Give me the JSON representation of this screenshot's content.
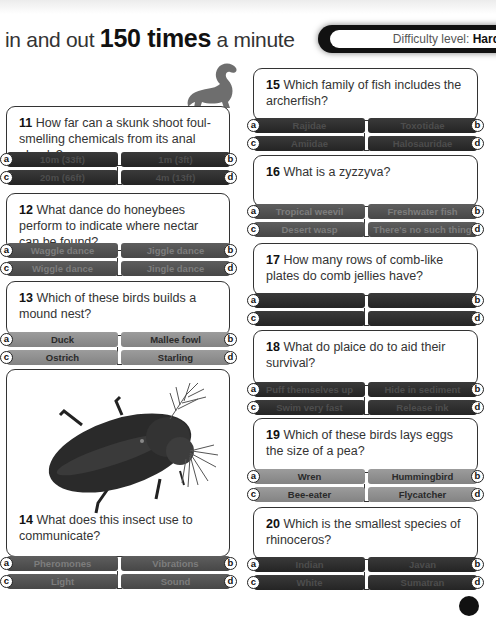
{
  "header": {
    "title_prefix": "in and out ",
    "title_bold": "150 times",
    "title_suffix": " a minute",
    "difficulty_label": "Difficulty level: ",
    "difficulty_value": "Hard"
  },
  "questions": [
    {
      "number": "11",
      "text": "How far can a skunk shoot foul-smelling chemicals from its anal glands?",
      "shade": "dark",
      "options": {
        "a": "10m (33ft)",
        "b": "1m (3ft)",
        "c": "20m (66ft)",
        "d": "4m (13ft)"
      }
    },
    {
      "number": "12",
      "text": "What dance do honeybees perform to indicate where nectar can be found?",
      "shade": "mid",
      "options": {
        "a": "Waggle dance",
        "b": "Jiggle dance",
        "c": "Wiggle dance",
        "d": "Jingle dance"
      }
    },
    {
      "number": "13",
      "text": "Which of these birds builds a mound nest?",
      "shade": "light",
      "options": {
        "a": "Duck",
        "b": "Mallee fowl",
        "c": "Ostrich",
        "d": "Starling"
      }
    },
    {
      "number": "14",
      "text": "What does this insect use to communicate?",
      "shade": "mid",
      "options": {
        "a": "Pheromones",
        "b": "Vibrations",
        "c": "Light",
        "d": "Sound"
      }
    },
    {
      "number": "15",
      "text": "Which family of fish includes the archerfish?",
      "shade": "dark",
      "options": {
        "a": "Rajidae",
        "b": "Toxotidae",
        "c": "Amiidae",
        "d": "Halosauridae"
      }
    },
    {
      "number": "16",
      "text": "What is a zyzzyva?",
      "shade": "mid",
      "options": {
        "a": "Tropical weevil",
        "b": "Freshwater fish",
        "c": "Desert wasp",
        "d": "There's no such thing"
      }
    },
    {
      "number": "17",
      "text": "How many rows of comb-like plates do comb jellies have?",
      "shade": "dark",
      "options": {
        "a": "",
        "b": "",
        "c": "",
        "d": ""
      }
    },
    {
      "number": "18",
      "text": "What do plaice do to aid their survival?",
      "shade": "dark",
      "options": {
        "a": "Puff themselves up",
        "b": "Hide in sediment",
        "c": "Swim very fast",
        "d": "Release ink"
      }
    },
    {
      "number": "19",
      "text": "Which of these birds lays eggs the size of a pea?",
      "shade": "light",
      "options": {
        "a": "Wren",
        "b": "Hummingbird",
        "c": "Bee-eater",
        "d": "Flycatcher"
      }
    },
    {
      "number": "20",
      "text": "Which is the smallest species of rhinoceros?",
      "shade": "dark",
      "options": {
        "a": "Indian",
        "b": "Javan",
        "c": "White",
        "d": "Sumatran"
      }
    }
  ],
  "badges": {
    "a": "a",
    "b": "b",
    "c": "c",
    "d": "d"
  },
  "colors": {
    "dark_option": "#2e2e2e",
    "mid_option": "#525252",
    "light_option": "#8f8f8f",
    "border": "#333333"
  }
}
